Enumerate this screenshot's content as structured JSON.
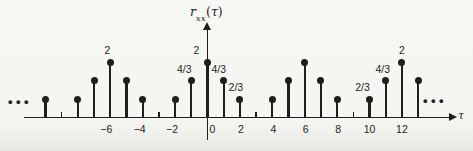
{
  "figure": {
    "ink_color": "#1e1e1e",
    "background_top": "#f7f7f4",
    "background_bottom": "#e7e7e4",
    "ylabel": {
      "func": "r",
      "subscript": "xx",
      "open": "(",
      "var": "τ",
      "close": ")"
    },
    "xlabel": "τ",
    "ellipsis_left": "•••",
    "ellipsis_right": "•••"
  },
  "chart_data": {
    "type": "stem",
    "title": "rxx(τ)",
    "xlabel": "τ",
    "ylabel": "rxx(τ)",
    "period": 6,
    "x_range_shown": [
      -10,
      13
    ],
    "ylim": [
      0,
      2
    ],
    "grid": false,
    "stems": [
      {
        "tau": -10,
        "value": 0.667
      },
      {
        "tau": -8,
        "value": 0.667
      },
      {
        "tau": -7,
        "value": 1.333
      },
      {
        "tau": -6,
        "value": 2
      },
      {
        "tau": -5,
        "value": 1.333
      },
      {
        "tau": -4,
        "value": 0.667
      },
      {
        "tau": -2,
        "value": 0.667
      },
      {
        "tau": -1,
        "value": 1.333
      },
      {
        "tau": 0,
        "value": 2
      },
      {
        "tau": 1,
        "value": 1.333
      },
      {
        "tau": 2,
        "value": 0.667
      },
      {
        "tau": 4,
        "value": 0.667
      },
      {
        "tau": 5,
        "value": 1.333
      },
      {
        "tau": 6,
        "value": 2
      },
      {
        "tau": 7,
        "value": 1.333
      },
      {
        "tau": 8,
        "value": 0.667
      },
      {
        "tau": 10,
        "value": 0.667
      },
      {
        "tau": 11,
        "value": 1.333
      },
      {
        "tau": 12,
        "value": 2
      },
      {
        "tau": 13,
        "value": 1.333
      }
    ],
    "zero_value_ticks": [
      -9,
      -3,
      3,
      9
    ],
    "x_tick_labels": [
      {
        "tau": -6,
        "text": "−6",
        "dx": -4
      },
      {
        "tau": -4,
        "text": "−4",
        "dx": -3
      },
      {
        "tau": -2,
        "text": "−2",
        "dx": -3
      },
      {
        "tau": 0,
        "text": "0",
        "dx": 5
      },
      {
        "tau": 2,
        "text": "2",
        "dx": 1
      },
      {
        "tau": 4,
        "text": "4",
        "dx": 1
      },
      {
        "tau": 6,
        "text": "6",
        "dx": 1
      },
      {
        "tau": 8,
        "text": "8",
        "dx": 1
      },
      {
        "tau": 10,
        "text": "10",
        "dx": 0
      },
      {
        "tau": 12,
        "text": "12",
        "dx": 0
      }
    ],
    "value_labels": [
      {
        "tau": -6,
        "text": "2",
        "dx": -3
      },
      {
        "tau": -1,
        "text": "4/3",
        "dx": -7
      },
      {
        "tau": 0,
        "text": "2",
        "dx": -11
      },
      {
        "tau": 1,
        "text": "4/3",
        "dx": -5
      },
      {
        "tau": 2,
        "text": "2/3",
        "dx": -4
      },
      {
        "tau": 10,
        "text": "2/3",
        "dx": -7
      },
      {
        "tau": 11,
        "text": "4/3",
        "dx": -3
      },
      {
        "tau": 12,
        "text": "2",
        "dx": 0
      }
    ],
    "layout": {
      "origin_x": 207.5,
      "axis_y": 118,
      "px_per_tau": 16.2,
      "px_per_value_unit": 28,
      "dot_diameter": 7,
      "stem_width": 2.2,
      "zero_tick_height": 6.5,
      "x_axis_start": 24,
      "x_axis_end": 451,
      "y_axis_top": 29,
      "y_axis_bottom": 140
    }
  }
}
